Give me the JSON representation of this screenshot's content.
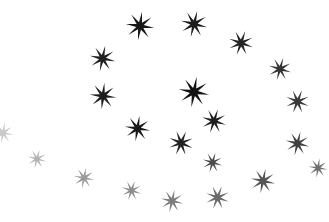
{
  "scene": {
    "title": "Star Field",
    "width": 329,
    "height": 222,
    "background_color": "#ffffff",
    "shape_kind": "eight-pointed-star",
    "star_count": 21,
    "description": "Loose spiral arrangement of eight-pointed stars fading from black at top to light gray at bottom-left"
  },
  "stars": [
    {
      "id": "star-01",
      "name": "star-top-left-upper",
      "cx": 140,
      "cy": 26,
      "size": 30,
      "rotation": 8,
      "color": "#181818",
      "opacity": 1.0
    },
    {
      "id": "star-02",
      "name": "star-top-mid",
      "cx": 194,
      "cy": 24,
      "size": 28,
      "rotation": 14,
      "color": "#1d1d1d",
      "opacity": 1.0
    },
    {
      "id": "star-03",
      "name": "star-top-right",
      "cx": 241,
      "cy": 43,
      "size": 26,
      "rotation": 20,
      "color": "#242424",
      "opacity": 1.0
    },
    {
      "id": "star-04",
      "name": "star-upper-left",
      "cx": 102,
      "cy": 58,
      "size": 27,
      "rotation": 12,
      "color": "#202020",
      "opacity": 1.0
    },
    {
      "id": "star-05",
      "name": "star-right-upper",
      "cx": 280,
      "cy": 69,
      "size": 24,
      "rotation": 16,
      "color": "#333333",
      "opacity": 1.0
    },
    {
      "id": "star-06",
      "name": "star-center-bright",
      "cx": 194,
      "cy": 92,
      "size": 32,
      "rotation": 10,
      "color": "#121212",
      "opacity": 1.0
    },
    {
      "id": "star-07",
      "name": "star-mid-left",
      "cx": 103,
      "cy": 96,
      "size": 28,
      "rotation": 6,
      "color": "#1c1c1c",
      "opacity": 1.0
    },
    {
      "id": "star-08",
      "name": "star-right-mid",
      "cx": 297,
      "cy": 101,
      "size": 25,
      "rotation": 22,
      "color": "#3a3a3a",
      "opacity": 1.0
    },
    {
      "id": "star-09",
      "name": "star-center-right",
      "cx": 214,
      "cy": 121,
      "size": 26,
      "rotation": 18,
      "color": "#1f1f1f",
      "opacity": 1.0
    },
    {
      "id": "star-10",
      "name": "star-center-lower",
      "cx": 137,
      "cy": 128,
      "size": 27,
      "rotation": 9,
      "color": "#1a1a1a",
      "opacity": 1.0
    },
    {
      "id": "star-11",
      "name": "star-center-bottom",
      "cx": 181,
      "cy": 143,
      "size": 26,
      "rotation": 24,
      "color": "#222222",
      "opacity": 1.0
    },
    {
      "id": "star-12",
      "name": "star-right-lower",
      "cx": 297,
      "cy": 143,
      "size": 25,
      "rotation": 14,
      "color": "#3f3f3f",
      "opacity": 1.0
    },
    {
      "id": "star-13",
      "name": "star-edge-left-clipped",
      "cx": 3,
      "cy": 133,
      "size": 22,
      "rotation": 10,
      "color": "#c9c9c9",
      "opacity": 1.0
    },
    {
      "id": "star-14",
      "name": "star-bottom-left-pale",
      "cx": 37,
      "cy": 159,
      "size": 20,
      "rotation": 15,
      "color": "#b4b4b4",
      "opacity": 1.0
    },
    {
      "id": "star-15",
      "name": "star-bottom-left-mid",
      "cx": 84,
      "cy": 178,
      "size": 22,
      "rotation": 11,
      "color": "#9a9a9a",
      "opacity": 1.0
    },
    {
      "id": "star-16",
      "name": "star-bottom-pale-a",
      "cx": 131,
      "cy": 190,
      "size": 21,
      "rotation": 19,
      "color": "#8d8d8d",
      "opacity": 1.0
    },
    {
      "id": "star-17",
      "name": "star-bottom-pale-b",
      "cx": 172,
      "cy": 201,
      "size": 24,
      "rotation": 13,
      "color": "#7c7c7c",
      "opacity": 1.0
    },
    {
      "id": "star-18",
      "name": "star-bottom-pale-c",
      "cx": 217,
      "cy": 197,
      "size": 25,
      "rotation": 21,
      "color": "#6b6b6b",
      "opacity": 1.0
    },
    {
      "id": "star-19",
      "name": "star-bottom-right",
      "cx": 263,
      "cy": 181,
      "size": 26,
      "rotation": 12,
      "color": "#555555",
      "opacity": 1.0
    },
    {
      "id": "star-20",
      "name": "star-bottom-right-top",
      "cx": 212,
      "cy": 162,
      "size": 21,
      "rotation": 17,
      "color": "#4a4a4a",
      "opacity": 1.0
    },
    {
      "id": "star-21",
      "name": "star-right-edge-low",
      "cx": 318,
      "cy": 168,
      "size": 20,
      "rotation": 9,
      "color": "#6f6f6f",
      "opacity": 1.0
    }
  ]
}
